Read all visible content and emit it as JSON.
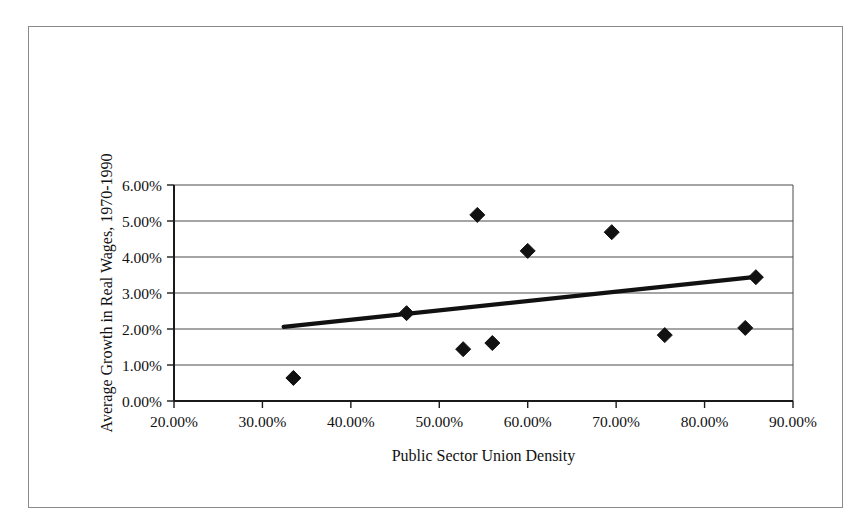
{
  "figure": {
    "border_color": "#8a8a8a",
    "background": "#ffffff",
    "marker_color": "#111111",
    "trendline_color": "#111111",
    "gridline_color": "#4a4a4a"
  },
  "chart_data": {
    "type": "scatter",
    "title": "",
    "subtitle": "",
    "xlabel": "Public Sector Union Density",
    "ylabel": "Average Growth in Real Wages, 1970-1990",
    "xlim": [
      20,
      90
    ],
    "ylim": [
      0,
      6
    ],
    "xtick_labels": [
      "20.00%",
      "30.00%",
      "40.00%",
      "50.00%",
      "60.00%",
      "70.00%",
      "80.00%",
      "90.00%"
    ],
    "xtick_values": [
      20,
      30,
      40,
      50,
      60,
      70,
      80,
      90
    ],
    "ytick_labels": [
      "0.00%",
      "1.00%",
      "2.00%",
      "3.00%",
      "4.00%",
      "5.00%",
      "6.00%"
    ],
    "ytick_values": [
      0,
      1,
      2,
      3,
      4,
      5,
      6
    ],
    "grid": "horizontal",
    "legend": "none",
    "marker_shape": "diamond",
    "series": [
      {
        "name": "Observations",
        "points": [
          {
            "x": 33.5,
            "y": 0.64
          },
          {
            "x": 46.3,
            "y": 2.44
          },
          {
            "x": 52.7,
            "y": 1.44
          },
          {
            "x": 54.3,
            "y": 5.17
          },
          {
            "x": 56.0,
            "y": 1.61
          },
          {
            "x": 60.0,
            "y": 4.17
          },
          {
            "x": 69.5,
            "y": 4.69
          },
          {
            "x": 75.5,
            "y": 1.83
          },
          {
            "x": 84.6,
            "y": 2.03
          },
          {
            "x": 85.8,
            "y": 3.44
          }
        ]
      }
    ],
    "trendline": {
      "type": "linear",
      "x_start": 32.4,
      "y_start": 2.06,
      "x_end": 85.8,
      "y_end": 3.45
    }
  }
}
